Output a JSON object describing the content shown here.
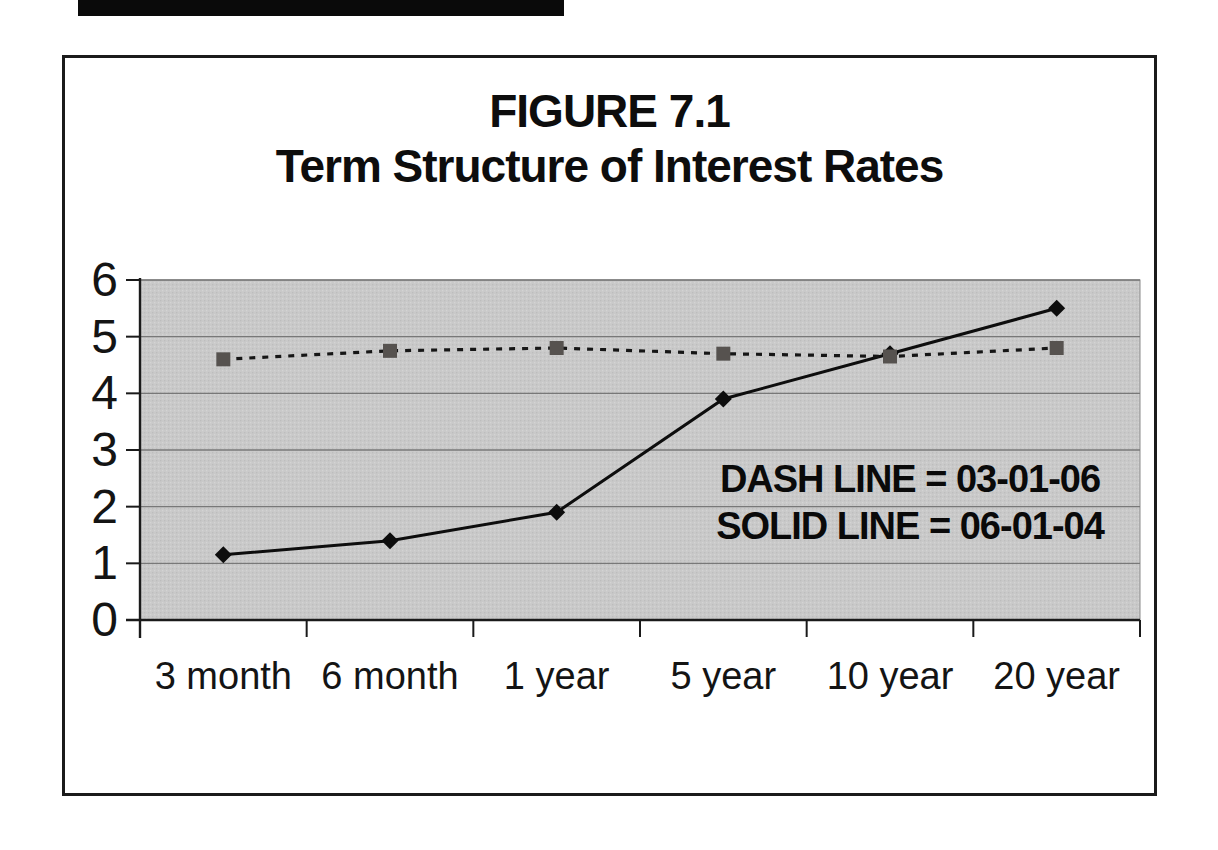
{
  "figure": {
    "title_line1": "FIGURE 7.1",
    "title_line2": "Term Structure of Interest Rates"
  },
  "annotation": {
    "line1": "DASH LINE = 03-01-06",
    "line2": "SOLID LINE = 06-01-04"
  },
  "chart_data": {
    "type": "line",
    "title": "FIGURE 7.1",
    "subtitle": "Term Structure of Interest Rates",
    "categories": [
      "3 month",
      "6 month",
      "1 year",
      "5 year",
      "10 year",
      "20 year"
    ],
    "series": [
      {
        "name": "03-01-06",
        "legend_text": "DASH LINE = 03-01-06",
        "line_style": "dashed",
        "marker": "square",
        "marker_color": "#56524f",
        "line_color": "#161616",
        "values": [
          4.6,
          4.75,
          4.8,
          4.7,
          4.65,
          4.8
        ]
      },
      {
        "name": "06-01-04",
        "legend_text": "SOLID LINE = 06-01-04",
        "line_style": "solid",
        "marker": "diamond",
        "marker_color": "#0d0d0d",
        "line_color": "#0d0d0d",
        "values": [
          1.15,
          1.4,
          1.9,
          3.9,
          4.7,
          5.5
        ]
      }
    ],
    "xlabel": "",
    "ylabel": "",
    "ylim": [
      0,
      6
    ],
    "ytick_step": 1,
    "ytick_labels": [
      "0",
      "1",
      "2",
      "3",
      "4",
      "5",
      "6"
    ],
    "grid": "horizontal",
    "gridline_color": "#787878",
    "axis_color": "#1a1a1a",
    "plot_bg": "#c8c8c8",
    "legend_position": "in-plot text annotation"
  }
}
